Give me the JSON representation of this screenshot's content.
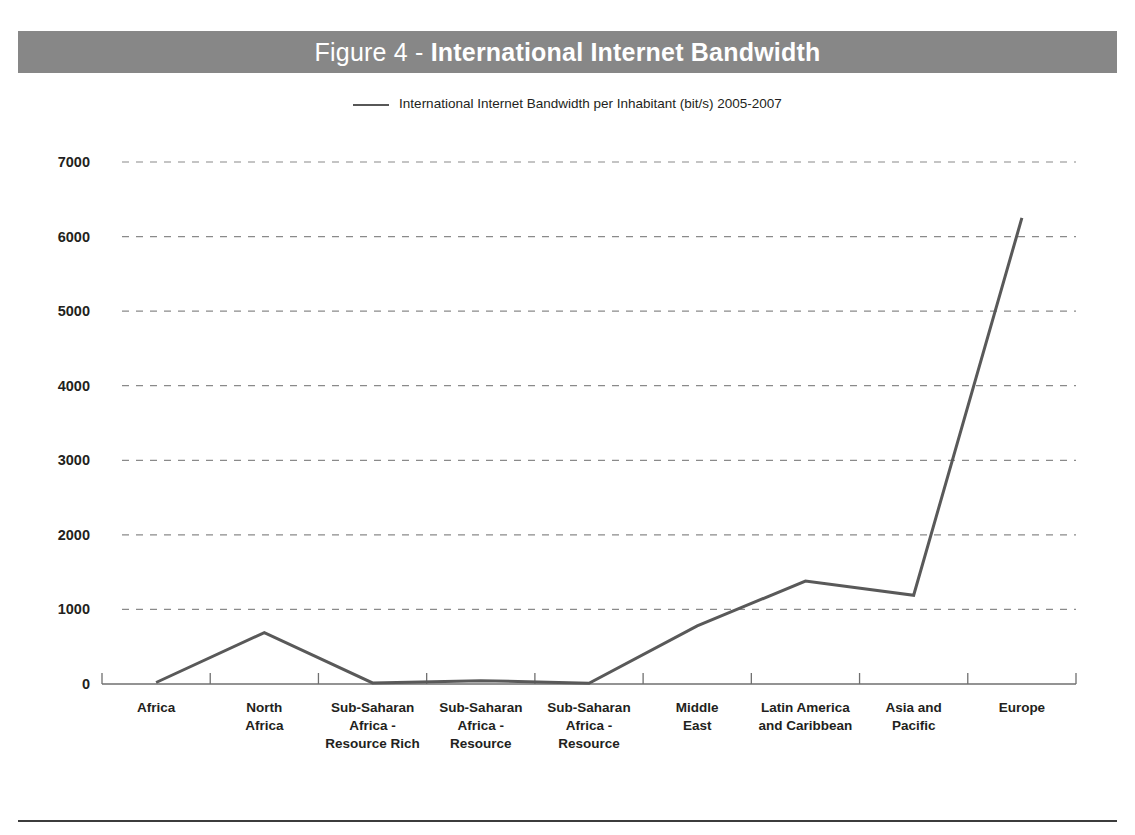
{
  "figure": {
    "title_prefix": "Figure 4 - ",
    "title_main": "International Internet Bandwidth",
    "title_bar_color": "#878787"
  },
  "legend": {
    "position": "top-center",
    "entries": [
      {
        "label": "International Internet Bandwidth per Inhabitant (bit/s) 2005-2007",
        "color": "#595959",
        "marker": "line-swatch"
      }
    ]
  },
  "axes": {
    "y_tick_labels": [
      "7000",
      "6000",
      "5000",
      "4000",
      "3000",
      "2000",
      "1000",
      "0"
    ],
    "x_tick_labels": [
      "Africa",
      "North Africa",
      "Sub-Saharan Africa - Resource Rich",
      "Sub-Saharan Africa - Resource Scarce Coastal",
      "Sub-Saharan Africa - Resource Scarce Landlocked",
      "Middle East",
      "Latin America and Caribbean",
      "Asia and Pacific",
      "Europe"
    ],
    "x_tick_lines": [
      [
        "Africa"
      ],
      [
        "North",
        "Africa"
      ],
      [
        "Sub-Saharan",
        "Africa -",
        "Resource Rich"
      ],
      [
        "Sub-Saharan",
        "Africa -",
        "Resource",
        "Scarce",
        "Coastal"
      ],
      [
        "Sub-Saharan",
        "Africa -",
        "Resource",
        "Scarce",
        "Landlocked"
      ],
      [
        "Middle",
        "East"
      ],
      [
        "Latin America",
        "and Caribbean"
      ],
      [
        "Asia and",
        "Pacific"
      ],
      [
        "Europe"
      ]
    ]
  },
  "chart_data": {
    "type": "line",
    "title": "Figure 4 - International Internet Bandwidth",
    "xlabel": "",
    "ylabel": "",
    "ylim": [
      0,
      7000
    ],
    "ytick_step": 1000,
    "grid": true,
    "legend_position": "top-center",
    "categories": [
      "Africa",
      "North Africa",
      "Sub-Saharan Africa - Resource Rich",
      "Sub-Saharan Africa - Resource Scarce Coastal",
      "Sub-Saharan Africa - Resource Scarce Landlocked",
      "Middle East",
      "Latin America and Caribbean",
      "Asia and Pacific",
      "Europe"
    ],
    "series": [
      {
        "name": "International Internet Bandwidth per Inhabitant (bit/s) 2005-2007",
        "color": "#595959",
        "values": [
          20,
          690,
          15,
          45,
          10,
          780,
          1380,
          1190,
          6250
        ]
      }
    ]
  }
}
